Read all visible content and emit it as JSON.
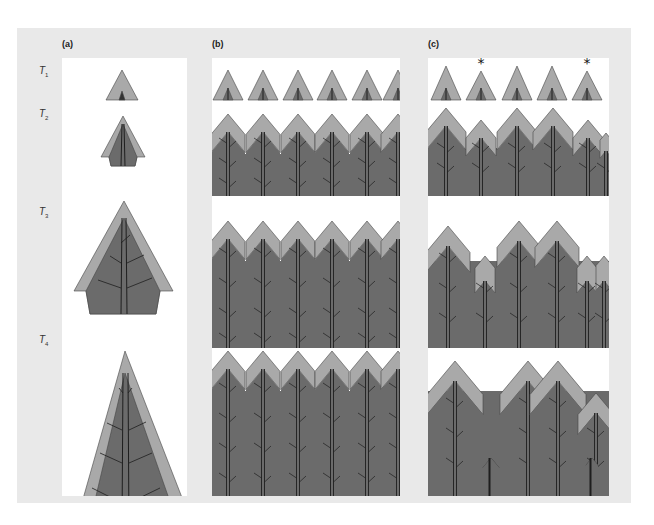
{
  "figure": {
    "colors": {
      "background": "#e9e9e9",
      "panel": "#ffffff",
      "crown_light": "#a9a9a9",
      "crown_dark": "#6b6b6b",
      "stem": "#1e1e1e",
      "outline": "#444444"
    },
    "panels": [
      {
        "id": "a",
        "label": "(a)",
        "description": "Single open-grown tree"
      },
      {
        "id": "b",
        "label": "(b)",
        "description": "Even-aged stand, uniform growth"
      },
      {
        "id": "c",
        "label": "(c)",
        "description": "Stand with differentiation into crown classes"
      }
    ],
    "rows": [
      {
        "symbol": "T",
        "subscript": "1"
      },
      {
        "symbol": "T",
        "subscript": "2"
      },
      {
        "symbol": "T",
        "subscript": "3"
      },
      {
        "symbol": "T",
        "subscript": "4"
      }
    ],
    "annotations": {
      "asterisk": "*",
      "asterisk_positions_panel_c_row1": [
        2,
        5
      ]
    }
  }
}
